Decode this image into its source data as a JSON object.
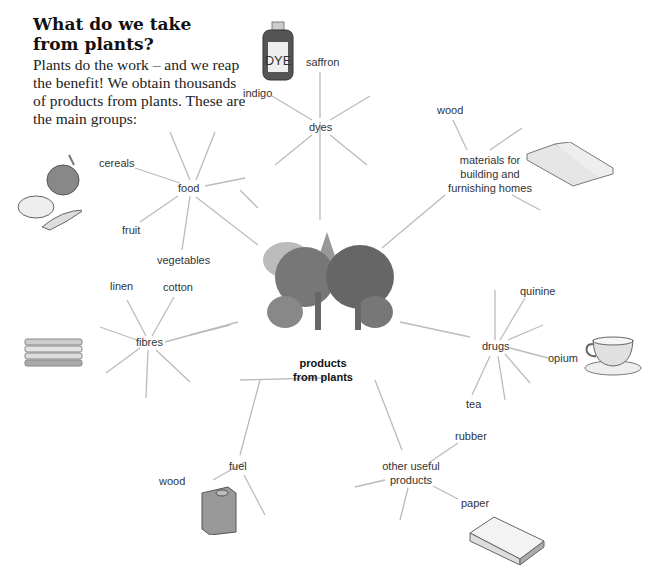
{
  "heading": {
    "title": "What do we take from plants?",
    "intro": "Plants do the work – and we reap the benefit! We obtain thousands of products from plants. These are the main groups:"
  },
  "center": {
    "label_line1": "products",
    "label_line2": "from plants"
  },
  "groups": {
    "dyes": {
      "label": "dyes",
      "items": [
        "saffron",
        "indigo"
      ]
    },
    "materials": {
      "label_line1": "materials for",
      "label_line2": "building and",
      "label_line3": "furnishing homes",
      "items": [
        "wood"
      ]
    },
    "food": {
      "label": "food",
      "items": [
        "cereals",
        "fruit",
        "vegetables"
      ]
    },
    "fibres": {
      "label": "fibres",
      "items": [
        "linen",
        "cotton"
      ]
    },
    "drugs": {
      "label": "drugs",
      "items": [
        "quinine",
        "opium",
        "tea"
      ]
    },
    "fuel": {
      "label": "fuel",
      "items": [
        "wood"
      ]
    },
    "other": {
      "label_line1": "other useful",
      "label_line2": "products",
      "items": [
        "rubber",
        "paper"
      ]
    }
  },
  "illustrations": {
    "dye_bottle_text": "DYE"
  }
}
